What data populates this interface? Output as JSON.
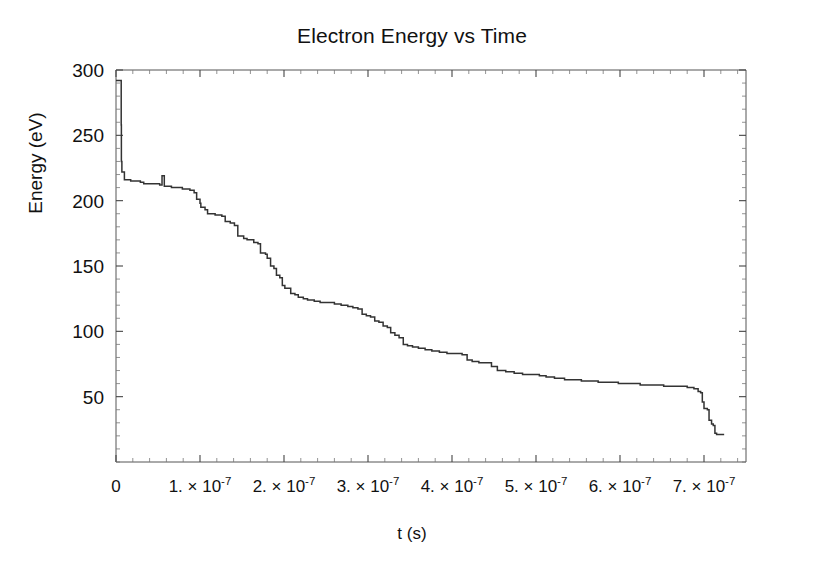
{
  "chart_data": {
    "type": "line",
    "title": "Electron Energy vs Time",
    "xlabel": "t (s)",
    "ylabel": "Energy (eV)",
    "xlim": [
      0,
      7.5e-07
    ],
    "ylim": [
      0,
      300
    ],
    "grid": false,
    "legend": null,
    "x_tick_labels": [
      {
        "value": 0,
        "mantissa": "0",
        "exponent": ""
      },
      {
        "value": 1e-07,
        "mantissa": "1. × 10",
        "exponent": "-7"
      },
      {
        "value": 2e-07,
        "mantissa": "2. × 10",
        "exponent": "-7"
      },
      {
        "value": 3e-07,
        "mantissa": "3. × 10",
        "exponent": "-7"
      },
      {
        "value": 4e-07,
        "mantissa": "4. × 10",
        "exponent": "-7"
      },
      {
        "value": 5e-07,
        "mantissa": "5. × 10",
        "exponent": "-7"
      },
      {
        "value": 6e-07,
        "mantissa": "6. × 10",
        "exponent": "-7"
      },
      {
        "value": 7e-07,
        "mantissa": "7. × 10",
        "exponent": "-7"
      }
    ],
    "y_tick_labels": [
      {
        "value": 50,
        "label": "50"
      },
      {
        "value": 100,
        "label": "100"
      },
      {
        "value": 150,
        "label": "150"
      },
      {
        "value": 200,
        "label": "200"
      },
      {
        "value": 250,
        "label": "250"
      },
      {
        "value": 300,
        "label": "300"
      }
    ],
    "x_minor_per_major": 5,
    "y_minor_per_major": 5,
    "line_color": "#333333",
    "series": [
      {
        "name": "electron energy",
        "x_units": "1e-7 s",
        "points": [
          [
            0.0,
            292
          ],
          [
            0.06,
            292
          ],
          [
            0.062,
            258
          ],
          [
            0.064,
            230
          ],
          [
            0.07,
            222
          ],
          [
            0.095,
            222
          ],
          [
            0.1,
            216
          ],
          [
            0.16,
            216
          ],
          [
            0.175,
            215
          ],
          [
            0.29,
            214
          ],
          [
            0.33,
            213
          ],
          [
            0.42,
            213
          ],
          [
            0.52,
            212
          ],
          [
            0.545,
            212
          ],
          [
            0.548,
            219
          ],
          [
            0.57,
            219
          ],
          [
            0.575,
            211
          ],
          [
            0.64,
            211
          ],
          [
            0.66,
            210
          ],
          [
            0.76,
            210
          ],
          [
            0.79,
            209
          ],
          [
            0.88,
            208
          ],
          [
            0.93,
            206
          ],
          [
            0.96,
            201
          ],
          [
            1.0,
            198
          ],
          [
            1.01,
            195
          ],
          [
            1.06,
            193
          ],
          [
            1.09,
            190
          ],
          [
            1.18,
            189
          ],
          [
            1.21,
            189
          ],
          [
            1.26,
            188
          ],
          [
            1.3,
            184
          ],
          [
            1.36,
            183
          ],
          [
            1.41,
            181
          ],
          [
            1.45,
            173
          ],
          [
            1.52,
            171
          ],
          [
            1.56,
            170
          ],
          [
            1.64,
            168
          ],
          [
            1.69,
            167
          ],
          [
            1.72,
            160
          ],
          [
            1.78,
            159
          ],
          [
            1.8,
            156
          ],
          [
            1.84,
            150
          ],
          [
            1.88,
            148
          ],
          [
            1.91,
            143
          ],
          [
            1.95,
            141
          ],
          [
            1.98,
            135
          ],
          [
            2.01,
            133
          ],
          [
            2.05,
            133
          ],
          [
            2.08,
            129
          ],
          [
            2.13,
            128
          ],
          [
            2.17,
            126
          ],
          [
            2.23,
            125
          ],
          [
            2.28,
            124
          ],
          [
            2.36,
            123
          ],
          [
            2.43,
            122
          ],
          [
            2.52,
            122
          ],
          [
            2.6,
            121
          ],
          [
            2.68,
            120
          ],
          [
            2.76,
            119
          ],
          [
            2.82,
            118
          ],
          [
            2.88,
            117
          ],
          [
            2.93,
            113
          ],
          [
            2.98,
            112
          ],
          [
            3.03,
            111
          ],
          [
            3.08,
            108
          ],
          [
            3.13,
            107
          ],
          [
            3.18,
            104
          ],
          [
            3.23,
            103
          ],
          [
            3.27,
            99
          ],
          [
            3.32,
            97
          ],
          [
            3.37,
            95
          ],
          [
            3.42,
            90
          ],
          [
            3.47,
            89
          ],
          [
            3.53,
            88
          ],
          [
            3.6,
            87
          ],
          [
            3.68,
            86
          ],
          [
            3.76,
            85
          ],
          [
            3.85,
            84
          ],
          [
            3.94,
            83
          ],
          [
            4.03,
            83
          ],
          [
            4.12,
            82
          ],
          [
            4.18,
            78
          ],
          [
            4.24,
            77
          ],
          [
            4.32,
            76
          ],
          [
            4.4,
            76
          ],
          [
            4.47,
            73
          ],
          [
            4.54,
            70
          ],
          [
            4.64,
            69
          ],
          [
            4.74,
            68
          ],
          [
            4.84,
            67
          ],
          [
            4.94,
            67
          ],
          [
            5.04,
            66
          ],
          [
            5.12,
            65
          ],
          [
            5.22,
            64
          ],
          [
            5.34,
            63
          ],
          [
            5.44,
            63
          ],
          [
            5.54,
            62
          ],
          [
            5.64,
            62
          ],
          [
            5.74,
            61
          ],
          [
            5.86,
            61
          ],
          [
            5.98,
            60
          ],
          [
            6.1,
            60
          ],
          [
            6.24,
            59
          ],
          [
            6.38,
            59
          ],
          [
            6.52,
            58
          ],
          [
            6.66,
            58
          ],
          [
            6.8,
            57
          ],
          [
            6.88,
            56
          ],
          [
            6.93,
            54
          ],
          [
            6.96,
            53
          ],
          [
            6.98,
            46
          ],
          [
            7.0,
            41
          ],
          [
            7.04,
            40
          ],
          [
            7.06,
            32
          ],
          [
            7.09,
            29
          ],
          [
            7.11,
            28
          ],
          [
            7.13,
            22
          ],
          [
            7.15,
            21
          ],
          [
            7.24,
            21
          ]
        ]
      }
    ]
  }
}
